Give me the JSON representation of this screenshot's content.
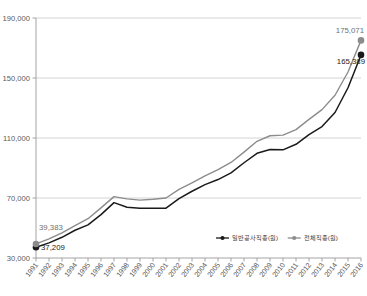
{
  "chart_data": {
    "type": "line",
    "title": "",
    "xlabel": "",
    "ylabel": "",
    "ylim": [
      30000,
      190000
    ],
    "yticks": [
      "30,000",
      "70,000",
      "110,000",
      "150,000",
      "190,000"
    ],
    "ytick_values": [
      30000,
      70000,
      110000,
      150000,
      190000
    ],
    "grid": true,
    "legend_position": "bottom-right",
    "categories": [
      "1991",
      "1992",
      "1993",
      "1994",
      "1995",
      "1996",
      "1997",
      "1998",
      "1999",
      "2000",
      "2001",
      "2002",
      "2003",
      "2004",
      "2005",
      "2006",
      "2007",
      "2008",
      "2009",
      "2010",
      "2011",
      "2012",
      "2013",
      "2014",
      "2015",
      "2016"
    ],
    "series": [
      {
        "name": "일반공사직종(원)",
        "color": "#1a1a1a",
        "marker": "circle",
        "values": [
          37209,
          40100,
          43800,
          48500,
          52100,
          58900,
          66900,
          63800,
          63200,
          63100,
          63200,
          69600,
          74500,
          78900,
          82300,
          86800,
          93500,
          99800,
          102300,
          102100,
          105800,
          112200,
          117600,
          127000,
          143500,
          165389
        ],
        "start_label": "37,209",
        "end_label": "165,389"
      },
      {
        "name": "전체직종(원)",
        "color": "#8c8c8c",
        "marker": "circle",
        "values": [
          39383,
          42700,
          46800,
          51600,
          56200,
          63400,
          70900,
          69400,
          68600,
          69200,
          70000,
          75800,
          80100,
          84700,
          88900,
          93700,
          100600,
          107800,
          111500,
          111900,
          115600,
          122400,
          128900,
          138500,
          154000,
          175071
        ],
        "start_label": "39,383",
        "end_label": "175,071"
      }
    ],
    "annotations": [
      {
        "text": "39,383",
        "series": "전체직종(원)",
        "point": "1991"
      },
      {
        "text": "37,209",
        "series": "일반공사직종(원)",
        "point": "1991"
      },
      {
        "text": "175,071",
        "series": "전체직종(원)",
        "point": "2016"
      },
      {
        "text": "165,389",
        "series": "일반공사직종(원)",
        "point": "2016"
      }
    ]
  },
  "legend": {
    "items": [
      {
        "label": "일반공사직종(원)",
        "color": "#1a1a1a"
      },
      {
        "label": "전체직종(원)",
        "color": "#8c8c8c"
      }
    ]
  },
  "colors": {
    "axis": "#9a9a9a",
    "grid": "#c9c9c9",
    "series_primary": "#1a1a1a",
    "series_secondary": "#8c8c8c",
    "text": "#5a5a5a"
  }
}
